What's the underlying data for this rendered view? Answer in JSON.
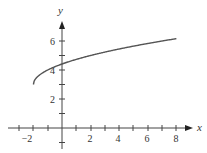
{
  "chart_data": {
    "type": "line",
    "title": "",
    "xlabel": "x",
    "ylabel": "y",
    "xlim": [
      -3.1,
      9
    ],
    "ylim": [
      -1.4,
      7.5
    ],
    "grid": false,
    "legend": null,
    "x_ticks": [
      -3,
      -2,
      -1,
      0,
      1,
      2,
      3,
      4,
      5,
      6,
      7,
      8
    ],
    "x_tick_labels": {
      "-2": "−2",
      "2": "2",
      "4": "4",
      "6": "6",
      "8": "8"
    },
    "y_ticks": [
      -1,
      1,
      2,
      3,
      4,
      5,
      6
    ],
    "y_tick_labels": {
      "2": "2",
      "4": "4",
      "6": "6"
    },
    "series": [
      {
        "name": "y = √(x+2) + 3",
        "x": [
          -2,
          -1.5,
          -1,
          0,
          1,
          2,
          3,
          4,
          5,
          6,
          7,
          8
        ],
        "y": [
          3,
          3.71,
          4,
          4.41,
          4.73,
          5,
          5.24,
          5.45,
          5.65,
          5.83,
          6,
          6.16
        ]
      }
    ],
    "color": "#555555"
  },
  "labels": {
    "x_axis": "x",
    "y_axis": "y",
    "xt_m2": "−2",
    "xt_2": "2",
    "xt_4": "4",
    "xt_6": "6",
    "xt_8": "8",
    "yt_2": "2",
    "yt_4": "4",
    "yt_6": "6"
  }
}
